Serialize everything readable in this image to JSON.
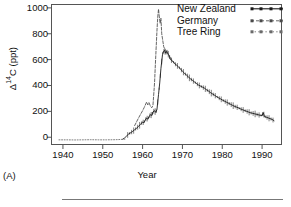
{
  "figure": {
    "panel_tag": "(A)",
    "background": "#ffffff",
    "frame_color": "#555555"
  },
  "axes": {
    "ylabel_text": "Δ",
    "ylabel_sup": "14",
    "ylabel_unit": "C (ppt)",
    "ylabel_full": "Δ14C (ppt)",
    "xlabel": "Year"
  },
  "legend": {
    "position": "top-right",
    "items": [
      {
        "label": "New Zealand",
        "style": "solid-dotted-marker",
        "color": "#1a1a1a"
      },
      {
        "label": "Germany",
        "style": "dashed-marker",
        "color": "#4a4a4a"
      },
      {
        "label": "Tree Ring",
        "style": "dotted-marker",
        "color": "#6a6a6a"
      }
    ]
  },
  "chart_data": {
    "type": "line",
    "title": "",
    "subtitle": "",
    "xlabel": "Year",
    "ylabel": "Δ14C (ppt)",
    "xlim": [
      1937,
      1995
    ],
    "ylim": [
      -60,
      1030
    ],
    "xticks": [
      1940,
      1950,
      1960,
      1970,
      1980,
      1990
    ],
    "xtick_labels": [
      "1940",
      "1950",
      "1960",
      "1970",
      "1980",
      "1990"
    ],
    "yticks": [
      0,
      200,
      400,
      600,
      800,
      1000
    ],
    "ytick_labels": [
      "0",
      "200",
      "400",
      "600",
      "800",
      "1000"
    ],
    "grid": false,
    "legend_position": "upper right",
    "annotations": [
      "(A)"
    ],
    "series": [
      {
        "name": "New Zealand",
        "style": "solid",
        "color": "#1a1a1a",
        "x": [
          1955.0,
          1955.5,
          1956.0,
          1956.5,
          1957.0,
          1957.5,
          1958.0,
          1958.5,
          1959.0,
          1959.5,
          1960.0,
          1960.3,
          1960.6,
          1961.0,
          1961.3,
          1961.6,
          1962.0,
          1962.3,
          1962.6,
          1963.0,
          1963.3,
          1963.6,
          1964.0,
          1964.3,
          1964.6,
          1965.0,
          1965.2,
          1965.5,
          1965.8,
          1966.0,
          1966.3,
          1966.6,
          1967.0,
          1967.5,
          1968.0,
          1968.5,
          1969.0,
          1969.5,
          1970.0,
          1970.5,
          1971.0,
          1971.5,
          1972.0,
          1972.5,
          1973.0,
          1973.5,
          1974.0,
          1974.5,
          1975.0,
          1975.5,
          1976.0,
          1976.5,
          1977.0,
          1977.5,
          1978.0,
          1978.5,
          1979.0,
          1979.5,
          1980.0,
          1980.5,
          1981.0,
          1981.5,
          1982.0,
          1982.5,
          1983.0,
          1983.5,
          1984.0,
          1984.5,
          1985.0,
          1985.5,
          1986.0,
          1986.5,
          1987.0,
          1987.5,
          1988.0,
          1988.5,
          1989.0,
          1989.5,
          1990.0,
          1990.3,
          1990.6,
          1991.0,
          1991.5,
          1992.0,
          1992.5,
          1993.0
        ],
        "y": [
          -15,
          -5,
          10,
          25,
          35,
          45,
          58,
          70,
          85,
          100,
          118,
          112,
          130,
          148,
          140,
          158,
          175,
          168,
          196,
          205,
          192,
          214,
          330,
          420,
          530,
          640,
          660,
          672,
          650,
          665,
          648,
          636,
          600,
          590,
          570,
          558,
          545,
          528,
          510,
          496,
          480,
          466,
          452,
          440,
          428,
          416,
          404,
          396,
          388,
          380,
          368,
          358,
          346,
          336,
          326,
          316,
          306,
          298,
          288,
          280,
          272,
          264,
          256,
          248,
          240,
          234,
          228,
          220,
          214,
          208,
          202,
          196,
          190,
          186,
          182,
          178,
          174,
          170,
          168,
          190,
          160,
          156,
          150,
          144,
          138,
          128
        ]
      },
      {
        "name": "Germany",
        "style": "dashed",
        "color": "#4a4a4a",
        "x": [
          1958.0,
          1958.5,
          1959.0,
          1959.5,
          1960.0,
          1960.4,
          1960.8,
          1961.0,
          1961.3,
          1961.6,
          1962.0,
          1962.3,
          1962.6,
          1963.0,
          1963.2,
          1963.4,
          1963.6,
          1963.8,
          1964.0,
          1964.2,
          1964.4,
          1964.6,
          1964.8,
          1965.0,
          1965.3,
          1965.6,
          1966.0,
          1966.5,
          1967.0,
          1967.5,
          1968.0
        ],
        "y": [
          90,
          120,
          150,
          178,
          205,
          230,
          258,
          272,
          250,
          268,
          238,
          228,
          246,
          420,
          560,
          690,
          820,
          930,
          990,
          930,
          880,
          920,
          800,
          760,
          700,
          680,
          665,
          640,
          612,
          592,
          572
        ]
      },
      {
        "name": "Tree Ring",
        "style": "dotted",
        "color": "#6a6a6a",
        "x": [
          1939.0,
          1941.0,
          1943.0,
          1945.0,
          1947.0,
          1949.0,
          1951.0,
          1953.0,
          1954.0,
          1955.0,
          1955.8
        ],
        "y": [
          -20,
          -20,
          -21,
          -20,
          -19,
          -20,
          -20,
          -19,
          -18,
          -16,
          -14
        ]
      }
    ]
  }
}
